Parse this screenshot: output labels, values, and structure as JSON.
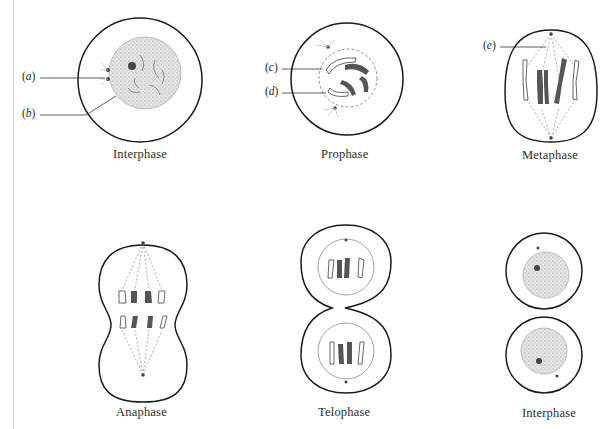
{
  "figure": {
    "type": "mitosis stages diagram",
    "stages": [
      {
        "id": "interphase-1",
        "label": "Interphase",
        "row": 1,
        "col": 1
      },
      {
        "id": "prophase",
        "label": "Prophase",
        "row": 1,
        "col": 2
      },
      {
        "id": "metaphase",
        "label": "Metaphase",
        "row": 1,
        "col": 3
      },
      {
        "id": "anaphase",
        "label": "Anaphase",
        "row": 2,
        "col": 1
      },
      {
        "id": "telophase",
        "label": "Telophase",
        "row": 2,
        "col": 2
      },
      {
        "id": "interphase-2",
        "label": "Interphase",
        "row": 2,
        "col": 3
      }
    ],
    "callouts": [
      {
        "id": "a",
        "open": "(",
        "letter": "a",
        "close": ")",
        "stage": "interphase-1",
        "points_to": "centrioles"
      },
      {
        "id": "b",
        "open": "(",
        "letter": "b",
        "close": ")",
        "stage": "interphase-1",
        "points_to": "nucleus"
      },
      {
        "id": "c",
        "open": "(",
        "letter": "c",
        "close": ")",
        "stage": "prophase",
        "points_to": "chromosome"
      },
      {
        "id": "d",
        "open": "(",
        "letter": "d",
        "close": ")",
        "stage": "prophase",
        "points_to": "chromosome"
      },
      {
        "id": "e",
        "open": "(",
        "letter": "e",
        "close": ")",
        "stage": "metaphase",
        "points_to": "spindle fiber"
      }
    ],
    "colors": {
      "outline": "#1a1a1a",
      "nucleus_fill": "#d9d9d9",
      "chromosome_dark": "#555555",
      "chromosome_light": "#ffffff",
      "spindle": "#8a8a8a"
    }
  }
}
